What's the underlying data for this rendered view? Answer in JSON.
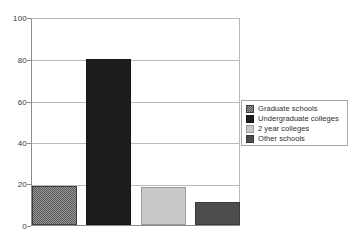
{
  "chart_data": {
    "type": "bar",
    "title": "",
    "subtitle": "",
    "xlabel": "",
    "ylabel": "",
    "ylim": [
      0,
      100
    ],
    "yticks": [
      0,
      20,
      40,
      60,
      80,
      100
    ],
    "ytick_labels": [
      "0",
      "20",
      "40",
      "60",
      "80",
      "100"
    ],
    "grid": true,
    "grid_axis": "y",
    "legend_position": "right",
    "categories": [
      "Graduate schools",
      "Undergraduate colleges",
      "2 year colleges",
      "Other schools"
    ],
    "values": [
      19,
      80.5,
      18.5,
      11
    ],
    "bars": [
      {
        "label": "Graduate schools",
        "value": 19,
        "fill_style": "checkered-dark",
        "color": "#575757"
      },
      {
        "label": "Undergraduate colleges",
        "value": 80.5,
        "fill_style": "solid-near-black",
        "color": "#1d1d1d"
      },
      {
        "label": "2 year colleges",
        "value": 18.5,
        "fill_style": "solid-light-gray",
        "color": "#c9c9c9"
      },
      {
        "label": "Other schools",
        "value": 11,
        "fill_style": "solid-mid-gray",
        "color": "#4d4d4d"
      }
    ]
  },
  "legend": {
    "entries": [
      {
        "label": "Graduate schools",
        "swatch": "checkered-dark",
        "color": "#575757"
      },
      {
        "label": "Undergraduate colleges",
        "swatch": "solid-near-black",
        "color": "#1d1d1d"
      },
      {
        "label": "2 year colleges",
        "swatch": "solid-light-gray",
        "color": "#c9c9c9"
      },
      {
        "label": "Other schools",
        "swatch": "solid-mid-gray",
        "color": "#4d4d4d"
      }
    ]
  },
  "axis": {
    "y_labels": [
      "100",
      "80",
      "60",
      "40",
      "20",
      "0"
    ]
  },
  "colors": {
    "background": "#ffffff",
    "gridline": "#b9b9b9",
    "axis": "#8c8c8c",
    "legend_border": "#a8a8a8",
    "text": "#2e2e2e"
  }
}
